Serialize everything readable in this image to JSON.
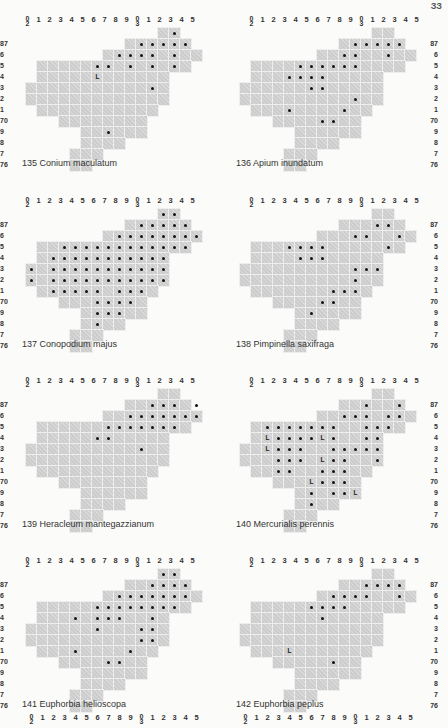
{
  "page_number": "ЗЗ",
  "grid": {
    "column_labels": [
      [
        "0",
        "2"
      ],
      [
        "1"
      ],
      [
        "2"
      ],
      [
        "3"
      ],
      [
        "4"
      ],
      [
        "5"
      ],
      [
        "6"
      ],
      [
        "7"
      ],
      [
        "8"
      ],
      [
        "9"
      ],
      [
        "0",
        "3"
      ],
      [
        "1"
      ],
      [
        "2"
      ],
      [
        "3"
      ],
      [
        "4"
      ],
      [
        "5"
      ]
    ],
    "row_labels": [
      "",
      "87",
      "6",
      "5",
      "4",
      "3",
      "2",
      "1",
      "70",
      "9",
      "8",
      "7",
      "76"
    ],
    "shape_rows": [
      [
        12,
        13
      ],
      [
        9,
        14
      ],
      [
        7,
        15
      ],
      [
        1,
        14
      ],
      [
        1,
        12
      ],
      [
        0,
        12
      ],
      [
        0,
        12
      ],
      [
        1,
        11
      ],
      [
        3,
        10
      ],
      [
        5,
        10
      ],
      [
        5,
        8
      ],
      [
        4,
        6
      ],
      [
        4,
        5
      ]
    ]
  },
  "maps": [
    {
      "number": "135",
      "species": "Conium maculatum",
      "dots": [
        [
          0,
          13
        ],
        [
          1,
          10
        ],
        [
          1,
          11
        ],
        [
          1,
          12
        ],
        [
          1,
          13
        ],
        [
          1,
          14
        ],
        [
          2,
          8
        ],
        [
          2,
          9
        ],
        [
          2,
          10
        ],
        [
          2,
          11
        ],
        [
          2,
          13
        ],
        [
          3,
          6
        ],
        [
          3,
          7
        ],
        [
          3,
          9
        ],
        [
          3,
          11
        ],
        [
          3,
          13
        ],
        [
          5,
          11
        ],
        [
          9,
          7
        ]
      ],
      "L": [
        [
          4,
          6
        ]
      ]
    },
    {
      "number": "136",
      "species": "Apium inundatum",
      "dots": [
        [
          1,
          10
        ],
        [
          1,
          11
        ],
        [
          1,
          12
        ],
        [
          1,
          13
        ],
        [
          1,
          14
        ],
        [
          2,
          9
        ],
        [
          2,
          10
        ],
        [
          2,
          13
        ],
        [
          3,
          5
        ],
        [
          3,
          6
        ],
        [
          3,
          7
        ],
        [
          3,
          8
        ],
        [
          3,
          9
        ],
        [
          3,
          10
        ],
        [
          4,
          4
        ],
        [
          4,
          5
        ],
        [
          4,
          6
        ],
        [
          4,
          7
        ],
        [
          5,
          6
        ],
        [
          5,
          7
        ],
        [
          6,
          10
        ],
        [
          7,
          4
        ],
        [
          7,
          9
        ],
        [
          8,
          7
        ],
        [
          8,
          8
        ]
      ],
      "L": []
    },
    {
      "number": "137",
      "species": "Conopodium majus",
      "dots": [
        [
          0,
          12
        ],
        [
          0,
          13
        ],
        [
          1,
          10
        ],
        [
          1,
          11
        ],
        [
          1,
          12
        ],
        [
          1,
          13
        ],
        [
          1,
          14
        ],
        [
          2,
          8
        ],
        [
          2,
          9
        ],
        [
          2,
          10
        ],
        [
          2,
          11
        ],
        [
          2,
          12
        ],
        [
          2,
          13
        ],
        [
          2,
          14
        ],
        [
          2,
          15
        ],
        [
          3,
          3
        ],
        [
          3,
          4
        ],
        [
          3,
          5
        ],
        [
          3,
          6
        ],
        [
          3,
          7
        ],
        [
          3,
          8
        ],
        [
          3,
          9
        ],
        [
          3,
          10
        ],
        [
          3,
          11
        ],
        [
          3,
          12
        ],
        [
          3,
          13
        ],
        [
          3,
          14
        ],
        [
          4,
          2
        ],
        [
          4,
          3
        ],
        [
          4,
          4
        ],
        [
          4,
          5
        ],
        [
          4,
          6
        ],
        [
          4,
          7
        ],
        [
          4,
          8
        ],
        [
          4,
          9
        ],
        [
          4,
          10
        ],
        [
          4,
          11
        ],
        [
          4,
          12
        ],
        [
          5,
          0
        ],
        [
          5,
          2
        ],
        [
          5,
          3
        ],
        [
          5,
          4
        ],
        [
          5,
          5
        ],
        [
          5,
          6
        ],
        [
          5,
          7
        ],
        [
          5,
          8
        ],
        [
          5,
          9
        ],
        [
          5,
          10
        ],
        [
          5,
          11
        ],
        [
          5,
          12
        ],
        [
          6,
          0
        ],
        [
          6,
          2
        ],
        [
          6,
          3
        ],
        [
          6,
          4
        ],
        [
          6,
          5
        ],
        [
          6,
          6
        ],
        [
          6,
          7
        ],
        [
          6,
          8
        ],
        [
          6,
          9
        ],
        [
          6,
          10
        ],
        [
          6,
          11
        ],
        [
          6,
          12
        ],
        [
          7,
          2
        ],
        [
          7,
          3
        ],
        [
          7,
          4
        ],
        [
          7,
          5
        ],
        [
          7,
          6
        ],
        [
          7,
          8
        ],
        [
          7,
          9
        ],
        [
          7,
          10
        ],
        [
          8,
          6
        ],
        [
          8,
          7
        ],
        [
          8,
          8
        ],
        [
          8,
          9
        ],
        [
          9,
          6
        ],
        [
          9,
          7
        ],
        [
          9,
          8
        ],
        [
          10,
          6
        ]
      ],
      "L": []
    },
    {
      "number": "138",
      "species": "Pimpinella saxifraga",
      "dots": [
        [
          1,
          12
        ],
        [
          1,
          13
        ],
        [
          2,
          10
        ],
        [
          2,
          11
        ],
        [
          2,
          14
        ],
        [
          3,
          13
        ],
        [
          3,
          4
        ],
        [
          3,
          5
        ],
        [
          3,
          6
        ],
        [
          3,
          7
        ],
        [
          4,
          5
        ],
        [
          4,
          6
        ],
        [
          4,
          7
        ],
        [
          5,
          10
        ],
        [
          5,
          11
        ],
        [
          5,
          12
        ],
        [
          6,
          10
        ],
        [
          7,
          8
        ],
        [
          7,
          9
        ],
        [
          7,
          10
        ],
        [
          8,
          7
        ],
        [
          8,
          8
        ],
        [
          9,
          6
        ]
      ],
      "L": []
    },
    {
      "number": "139",
      "species": "Heracleum mantegazzianum",
      "dots": [
        [
          1,
          11
        ],
        [
          1,
          12
        ],
        [
          1,
          13
        ],
        [
          1,
          15
        ],
        [
          2,
          9
        ],
        [
          2,
          10
        ],
        [
          2,
          11
        ],
        [
          2,
          12
        ],
        [
          2,
          13
        ],
        [
          2,
          14
        ],
        [
          2,
          15
        ],
        [
          3,
          7
        ],
        [
          3,
          8
        ],
        [
          3,
          9
        ],
        [
          3,
          10
        ],
        [
          3,
          11
        ],
        [
          3,
          12
        ],
        [
          3,
          13
        ],
        [
          4,
          6
        ],
        [
          4,
          7
        ],
        [
          5,
          10
        ]
      ],
      "L": []
    },
    {
      "number": "140",
      "species": "Mercurialis perennis",
      "dots": [
        [
          1,
          11
        ],
        [
          1,
          14
        ],
        [
          2,
          9
        ],
        [
          2,
          10
        ],
        [
          2,
          11
        ],
        [
          2,
          13
        ],
        [
          2,
          14
        ],
        [
          3,
          2
        ],
        [
          3,
          3
        ],
        [
          3,
          4
        ],
        [
          3,
          5
        ],
        [
          3,
          6
        ],
        [
          3,
          7
        ],
        [
          3,
          8
        ],
        [
          3,
          11
        ],
        [
          3,
          12
        ],
        [
          3,
          13
        ],
        [
          4,
          3
        ],
        [
          4,
          4
        ],
        [
          4,
          5
        ],
        [
          4,
          6
        ],
        [
          4,
          8
        ],
        [
          4,
          11
        ],
        [
          4,
          12
        ],
        [
          5,
          3
        ],
        [
          5,
          4
        ],
        [
          5,
          5
        ],
        [
          5,
          8
        ],
        [
          5,
          9
        ],
        [
          5,
          10
        ],
        [
          5,
          11
        ],
        [
          5,
          12
        ],
        [
          6,
          3
        ],
        [
          6,
          4
        ],
        [
          6,
          5
        ],
        [
          6,
          8
        ],
        [
          6,
          9
        ],
        [
          6,
          12
        ],
        [
          7,
          3
        ],
        [
          7,
          4
        ],
        [
          7,
          7
        ],
        [
          7,
          8
        ],
        [
          7,
          9
        ],
        [
          8,
          7
        ],
        [
          8,
          8
        ],
        [
          8,
          9
        ],
        [
          9,
          6
        ],
        [
          9,
          8
        ],
        [
          9,
          9
        ],
        [
          10,
          6
        ]
      ],
      "L": [
        [
          4,
          2
        ],
        [
          4,
          7
        ],
        [
          5,
          2
        ],
        [
          6,
          7
        ],
        [
          8,
          6
        ],
        [
          9,
          10
        ]
      ]
    },
    {
      "number": "141",
      "species": "Euphorbia helioscopa",
      "dots": [
        [
          0,
          12
        ],
        [
          0,
          13
        ],
        [
          1,
          11
        ],
        [
          1,
          12
        ],
        [
          1,
          13
        ],
        [
          1,
          14
        ],
        [
          2,
          8
        ],
        [
          2,
          9
        ],
        [
          2,
          10
        ],
        [
          2,
          11
        ],
        [
          2,
          12
        ],
        [
          2,
          13
        ],
        [
          2,
          14
        ],
        [
          3,
          6
        ],
        [
          3,
          7
        ],
        [
          3,
          8
        ],
        [
          3,
          9
        ],
        [
          3,
          10
        ],
        [
          3,
          11
        ],
        [
          3,
          12
        ],
        [
          3,
          13
        ],
        [
          4,
          4
        ],
        [
          4,
          6
        ],
        [
          4,
          7
        ],
        [
          4,
          8
        ],
        [
          4,
          11
        ],
        [
          5,
          6
        ],
        [
          5,
          10
        ],
        [
          5,
          11
        ],
        [
          6,
          10
        ],
        [
          6,
          11
        ],
        [
          7,
          4
        ],
        [
          7,
          9
        ],
        [
          8,
          7
        ],
        [
          8,
          8
        ]
      ],
      "L": []
    },
    {
      "number": "142",
      "species": "Euphorbia peplus",
      "dots": [
        [
          1,
          11
        ],
        [
          1,
          12
        ],
        [
          1,
          13
        ],
        [
          1,
          14
        ],
        [
          2,
          8
        ],
        [
          2,
          9
        ],
        [
          2,
          10
        ],
        [
          2,
          11
        ],
        [
          2,
          14
        ],
        [
          3,
          6
        ],
        [
          3,
          7
        ],
        [
          3,
          8
        ],
        [
          3,
          9
        ],
        [
          4,
          7
        ],
        [
          8,
          8
        ]
      ],
      "L": [
        [
          7,
          4
        ]
      ]
    }
  ],
  "footer_column_labels_repeat": true
}
